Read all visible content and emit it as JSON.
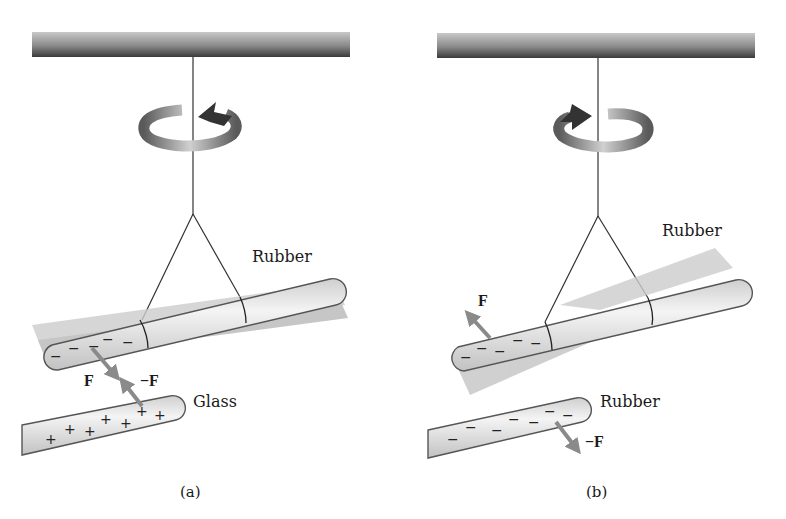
{
  "figure": {
    "panels": [
      {
        "id": "a",
        "caption": "(a)",
        "rotation": "counterclockwise",
        "suspended_rod_label": "Rubber",
        "suspended_rod_charge": "−",
        "fixed_rod_label": "Glass",
        "fixed_rod_charge": "+",
        "force_on_suspended": "F",
        "force_on_fixed": "−F",
        "interaction": "attraction"
      },
      {
        "id": "b",
        "caption": "(b)",
        "rotation": "clockwise",
        "suspended_rod_label": "Rubber",
        "suspended_rod_charge": "−",
        "fixed_rod_label": "Rubber",
        "fixed_rod_charge": "−",
        "force_on_suspended": "F",
        "force_on_fixed": "−F",
        "interaction": "repulsion"
      }
    ],
    "icons": {
      "support_bar": "ceiling-bar",
      "rotation_arrow": "circular-arrow-icon",
      "force_arrow": "force-arrow-icon"
    },
    "colors": {
      "bar_dark": "#3a3a3a",
      "bar_light": "#b0b0b0",
      "rod_fill": "#e4e4e4",
      "rod_outline": "#555555",
      "blur_shadow": "#bdbdbd",
      "force_arrow": "#8a8a8a",
      "rotation_arrow": "#5a5a5a"
    }
  }
}
